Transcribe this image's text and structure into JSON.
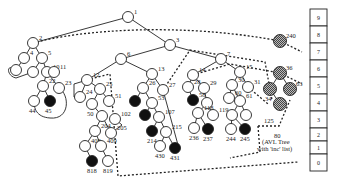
{
  "diagram": {
    "caption": {
      "line1": "(AVL Tree",
      "line2": "with 'inc' list)"
    },
    "colors": {
      "line": "#222222",
      "black_node": "#111111",
      "white_node": "#ffffff",
      "hatched_node": "#888888"
    },
    "array": {
      "cells": [
        "9",
        "8",
        "7",
        "6",
        "5",
        "4",
        "3",
        "2",
        "1",
        "0"
      ]
    },
    "nodes": [
      {
        "id": "1",
        "label": "1",
        "x": 128,
        "y": 17,
        "fill": "white"
      },
      {
        "id": "2",
        "label": "2",
        "x": 33,
        "y": 43,
        "fill": "white"
      },
      {
        "id": "3",
        "label": "3",
        "x": 170,
        "y": 45,
        "fill": "white"
      },
      {
        "id": "4",
        "label": "4",
        "x": 24,
        "y": 58,
        "fill": "white"
      },
      {
        "id": "5",
        "label": "5",
        "x": 42,
        "y": 58,
        "fill": "white"
      },
      {
        "id": "8",
        "label": "",
        "x": 16,
        "y": 70,
        "fill": "white"
      },
      {
        "id": "9",
        "label": "",
        "x": 33,
        "y": 72,
        "fill": "white"
      },
      {
        "id": "10",
        "label": "10",
        "x": 47,
        "y": 72,
        "fill": "white"
      },
      {
        "id": "11",
        "label": "11",
        "x": 54,
        "y": 72,
        "fill": "white"
      },
      {
        "id": "22",
        "label": "22",
        "x": 43,
        "y": 86,
        "fill": "white"
      },
      {
        "id": "23",
        "label": "23",
        "x": 59,
        "y": 88,
        "fill": "white"
      },
      {
        "id": "44",
        "label": "44",
        "x": 34,
        "y": 101,
        "fill": "white"
      },
      {
        "id": "45",
        "label": "45",
        "x": 50,
        "y": 101,
        "fill": "black"
      },
      {
        "id": "6",
        "label": "6",
        "x": 121,
        "y": 59,
        "fill": "white"
      },
      {
        "id": "12",
        "label": "12",
        "x": 87,
        "y": 80,
        "fill": "white"
      },
      {
        "id": "24",
        "label": "24",
        "x": 80,
        "y": 97,
        "fill": "white"
      },
      {
        "id": "25",
        "label": "25",
        "x": 100,
        "y": 89,
        "fill": "white"
      },
      {
        "id": "50",
        "label": "50",
        "x": 92,
        "y": 104,
        "fill": "white"
      },
      {
        "id": "51",
        "label": "51",
        "x": 109,
        "y": 101,
        "fill": "white"
      },
      {
        "id": "102",
        "label": "102",
        "x": 115,
        "y": 119,
        "fill": "white"
      },
      {
        "id": "101",
        "label": "",
        "x": 102,
        "y": 116,
        "fill": "white"
      },
      {
        "id": "204",
        "label": "204",
        "x": 95,
        "y": 131,
        "fill": "white"
      },
      {
        "id": "205",
        "label": "205",
        "x": 111,
        "y": 133,
        "fill": "white"
      },
      {
        "id": "408",
        "label": "408",
        "x": 85,
        "y": 146,
        "fill": "white"
      },
      {
        "id": "409",
        "label": "409",
        "x": 101,
        "y": 146,
        "fill": "white"
      },
      {
        "id": "818",
        "label": "818",
        "x": 92,
        "y": 161,
        "fill": "black"
      },
      {
        "id": "819",
        "label": "819",
        "x": 108,
        "y": 161,
        "fill": "white"
      },
      {
        "id": "13",
        "label": "13",
        "x": 152,
        "y": 74,
        "fill": "white"
      },
      {
        "id": "26",
        "label": "26",
        "x": 143,
        "y": 88,
        "fill": "white"
      },
      {
        "id": "27",
        "label": "27",
        "x": 163,
        "y": 90,
        "fill": "white"
      },
      {
        "id": "52",
        "label": "",
        "x": 135,
        "y": 101,
        "fill": "black"
      },
      {
        "id": "53",
        "label": "53",
        "x": 152,
        "y": 103,
        "fill": "white"
      },
      {
        "id": "106",
        "label": "",
        "x": 145,
        "y": 115,
        "fill": "black"
      },
      {
        "id": "107",
        "label": "107",
        "x": 159,
        "y": 117,
        "fill": "white"
      },
      {
        "id": "214",
        "label": "214",
        "x": 152,
        "y": 131,
        "fill": "black"
      },
      {
        "id": "215",
        "label": "215",
        "x": 166,
        "y": 132,
        "fill": "white"
      },
      {
        "id": "430",
        "label": "430",
        "x": 160,
        "y": 146,
        "fill": "white"
      },
      {
        "id": "431",
        "label": "431",
        "x": 175,
        "y": 148,
        "fill": "black"
      },
      {
        "id": "7",
        "label": "7",
        "x": 221,
        "y": 59,
        "fill": "white"
      },
      {
        "id": "14",
        "label": "14",
        "x": 193,
        "y": 75,
        "fill": "white"
      },
      {
        "id": "28",
        "label": "28",
        "x": 188,
        "y": 87,
        "fill": "white"
      },
      {
        "id": "29",
        "label": "29",
        "x": 204,
        "y": 88,
        "fill": "white"
      },
      {
        "id": "58",
        "label": "58",
        "x": 193,
        "y": 100,
        "fill": "black"
      },
      {
        "id": "59",
        "label": "",
        "x": 207,
        "y": 103,
        "fill": "white"
      },
      {
        "id": "118",
        "label": "118",
        "x": 198,
        "y": 113,
        "fill": "white"
      },
      {
        "id": "119",
        "label": "119",
        "x": 213,
        "y": 115,
        "fill": "white"
      },
      {
        "id": "236",
        "label": "236",
        "x": 194,
        "y": 128,
        "fill": "white"
      },
      {
        "id": "237",
        "label": "237",
        "x": 208,
        "y": 129,
        "fill": "black"
      },
      {
        "id": "15",
        "label": "15",
        "x": 240,
        "y": 72,
        "fill": "white"
      },
      {
        "id": "30",
        "label": "30",
        "x": 232,
        "y": 85,
        "fill": "white"
      },
      {
        "id": "31",
        "label": "31",
        "x": 248,
        "y": 87,
        "fill": "white"
      },
      {
        "id": "60",
        "label": "60",
        "x": 229,
        "y": 98,
        "fill": "white"
      },
      {
        "id": "61",
        "label": "61",
        "x": 240,
        "y": 101,
        "fill": "white"
      },
      {
        "id": "122",
        "label": "",
        "x": 232,
        "y": 115,
        "fill": "white"
      },
      {
        "id": "123",
        "label": "",
        "x": 246,
        "y": 115,
        "fill": "white"
      },
      {
        "id": "244",
        "label": "244",
        "x": 231,
        "y": 129,
        "fill": "white"
      },
      {
        "id": "245",
        "label": "245",
        "x": 245,
        "y": 129,
        "fill": "black"
      },
      {
        "id": "125",
        "label": "125",
        "x": 258,
        "y": 126,
        "fill": "none"
      },
      {
        "id": "240",
        "label": "240",
        "x": 280,
        "y": 41,
        "fill": "hatched"
      },
      {
        "id": "36",
        "label": "36",
        "x": 280,
        "y": 73,
        "fill": "hatched"
      },
      {
        "id": "34",
        "label": "34",
        "x": 270,
        "y": 89,
        "fill": "hatched"
      },
      {
        "id": "63",
        "label": "63",
        "x": 290,
        "y": 89,
        "fill": "hatched"
      },
      {
        "id": "33",
        "label": "",
        "x": 280,
        "y": 104,
        "fill": "hatched"
      },
      {
        "id": "80",
        "label": "80",
        "x": 279,
        "y": 126,
        "fill": "none"
      }
    ]
  }
}
